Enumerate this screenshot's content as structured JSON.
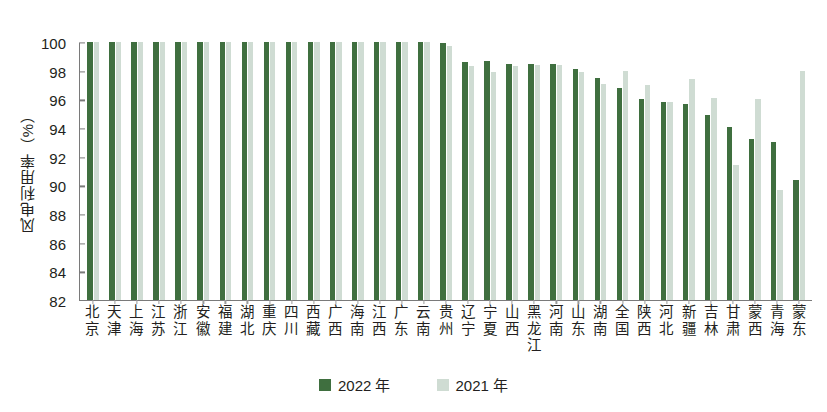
{
  "chart_data": {
    "type": "bar",
    "title": "",
    "subtitle": "",
    "xlabel": "",
    "ylabel": "风电利用率（%）",
    "ylim": [
      82,
      100
    ],
    "yticks": [
      82,
      84,
      86,
      88,
      90,
      92,
      94,
      96,
      98,
      100
    ],
    "grid": false,
    "legend_position": "bottom-center",
    "categories": [
      "北京",
      "天津",
      "上海",
      "江苏",
      "浙江",
      "安徽",
      "福建",
      "湖北",
      "重庆",
      "四川",
      "西藏",
      "广西",
      "海南",
      "江西",
      "广东",
      "云南",
      "贵州",
      "辽宁",
      "宁夏",
      "山西",
      "黑龙江",
      "河南",
      "山东",
      "湖南",
      "全国",
      "陕西",
      "河北",
      "新疆",
      "吉林",
      "甘肃",
      "蒙西",
      "青海",
      "蒙东"
    ],
    "series": [
      {
        "name": "2022 年",
        "color": "#3f6f3f",
        "values": [
          100.0,
          100.0,
          100.0,
          100.0,
          100.0,
          100.0,
          100.0,
          100.0,
          100.0,
          100.0,
          100.0,
          100.0,
          100.0,
          100.0,
          100.0,
          100.0,
          99.9,
          98.6,
          98.7,
          98.5,
          98.5,
          98.5,
          98.1,
          97.5,
          96.8,
          96.0,
          95.8,
          95.7,
          94.9,
          94.1,
          93.2,
          93.0,
          90.4
        ]
      },
      {
        "name": "2021 年",
        "color": "#cfdcd3",
        "values": [
          100.0,
          100.0,
          100.0,
          100.0,
          100.0,
          100.0,
          100.0,
          100.0,
          100.0,
          100.0,
          100.0,
          100.0,
          100.0,
          100.0,
          100.0,
          100.0,
          99.7,
          98.3,
          97.9,
          98.3,
          98.4,
          98.4,
          97.9,
          97.1,
          98.0,
          97.0,
          95.8,
          97.4,
          96.1,
          91.4,
          96.0,
          89.7,
          98.0
        ]
      }
    ]
  },
  "legend": {
    "items": [
      {
        "label": "2022 年",
        "color": "#3f6f3f"
      },
      {
        "label": "2021 年",
        "color": "#cfdcd3"
      }
    ]
  },
  "colors": {
    "series_2022": "#3f6f3f",
    "series_2021": "#cfdcd3",
    "axis": "#7a7a7a",
    "text": "#231f20",
    "background": "#ffffff"
  }
}
